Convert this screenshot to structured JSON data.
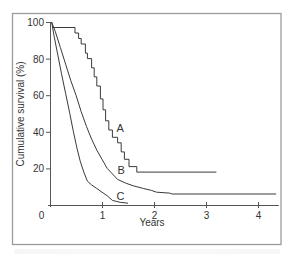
{
  "chart_data": {
    "type": "line",
    "subtype": "kaplan-meier step",
    "title": "",
    "xlabel": "Years",
    "ylabel": "Cumulative survival (%)",
    "xlim": [
      0,
      4.4
    ],
    "ylim": [
      0,
      100
    ],
    "x_ticks": [
      0,
      1,
      2,
      3,
      4
    ],
    "y_ticks": [
      20,
      40,
      60,
      80,
      100
    ],
    "grid": false,
    "legend": "inline labels A, B, C next to curves",
    "series": [
      {
        "name": "A",
        "points": [
          [
            0.05,
            97
          ],
          [
            0.48,
            97
          ],
          [
            0.48,
            94
          ],
          [
            0.55,
            94
          ],
          [
            0.55,
            91
          ],
          [
            0.6,
            91
          ],
          [
            0.6,
            88
          ],
          [
            0.68,
            88
          ],
          [
            0.68,
            83
          ],
          [
            0.72,
            83
          ],
          [
            0.72,
            80
          ],
          [
            0.8,
            80
          ],
          [
            0.8,
            75
          ],
          [
            0.85,
            75
          ],
          [
            0.85,
            70
          ],
          [
            0.9,
            70
          ],
          [
            0.9,
            65
          ],
          [
            0.97,
            65
          ],
          [
            0.97,
            58
          ],
          [
            1.02,
            58
          ],
          [
            1.02,
            52
          ],
          [
            1.07,
            52
          ],
          [
            1.07,
            46
          ],
          [
            1.13,
            46
          ],
          [
            1.13,
            41
          ],
          [
            1.2,
            41
          ],
          [
            1.2,
            37
          ],
          [
            1.3,
            37
          ],
          [
            1.3,
            34
          ],
          [
            1.37,
            34
          ],
          [
            1.37,
            29
          ],
          [
            1.43,
            29
          ],
          [
            1.43,
            25
          ],
          [
            1.52,
            25
          ],
          [
            1.52,
            21
          ],
          [
            1.67,
            21
          ],
          [
            1.67,
            18
          ],
          [
            3.2,
            18
          ]
        ]
      },
      {
        "name": "B",
        "points": [
          [
            0.03,
            100
          ],
          [
            0.1,
            95
          ],
          [
            0.2,
            86
          ],
          [
            0.3,
            77
          ],
          [
            0.4,
            68
          ],
          [
            0.5,
            60
          ],
          [
            0.6,
            51
          ],
          [
            0.7,
            43
          ],
          [
            0.8,
            36
          ],
          [
            0.9,
            30
          ],
          [
            1.0,
            25
          ],
          [
            1.1,
            20
          ],
          [
            1.2,
            17
          ],
          [
            1.3,
            14
          ],
          [
            1.45,
            12
          ],
          [
            1.6,
            10.5
          ],
          [
            1.8,
            9
          ],
          [
            1.95,
            8
          ],
          [
            2.05,
            7
          ],
          [
            2.3,
            6.5
          ],
          [
            2.35,
            6
          ],
          [
            4.35,
            6
          ]
        ]
      },
      {
        "name": "C",
        "points": [
          [
            0.03,
            100
          ],
          [
            0.08,
            92
          ],
          [
            0.15,
            82
          ],
          [
            0.22,
            72
          ],
          [
            0.3,
            61
          ],
          [
            0.38,
            50
          ],
          [
            0.45,
            40
          ],
          [
            0.52,
            31
          ],
          [
            0.58,
            24
          ],
          [
            0.65,
            18
          ],
          [
            0.72,
            13
          ],
          [
            0.8,
            11
          ],
          [
            0.9,
            9
          ],
          [
            1.0,
            7
          ],
          [
            1.1,
            5
          ],
          [
            1.2,
            2.5
          ],
          [
            1.35,
            1.5
          ],
          [
            1.5,
            1
          ]
        ]
      }
    ],
    "labels": [
      {
        "text": "A",
        "x": 1.28,
        "y": 40
      },
      {
        "text": "B",
        "x": 1.3,
        "y": 17
      },
      {
        "text": "C",
        "x": 1.28,
        "y": 3
      }
    ]
  },
  "axis": {
    "x_label": "Years",
    "y_label": "Cumulative survival (%)",
    "x_tick_labels": [
      "0",
      "1",
      "2",
      "3",
      "4"
    ],
    "y_tick_labels": [
      "100",
      "80",
      "60",
      "40",
      "20"
    ]
  },
  "colors": {
    "curve": "#3a3a3a",
    "axis": "#555555",
    "frame": "#9a9a9a",
    "text": "#333333"
  }
}
